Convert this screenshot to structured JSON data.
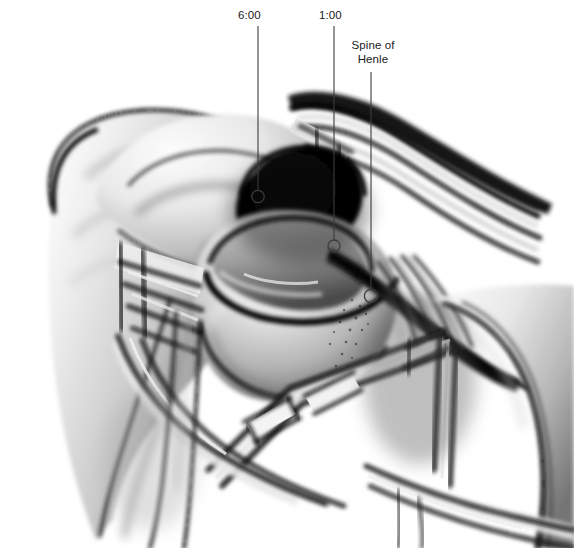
{
  "figure": {
    "kind": "medical-illustration",
    "background_color": "#ffffff",
    "width": 574,
    "height": 548,
    "ink_color": "#000000",
    "leader_color": "#3c3c3c"
  },
  "annotations": [
    {
      "id": "clock-6",
      "label": "6:00",
      "label_x": 238,
      "label_y": 8,
      "leader": {
        "x1": 258,
        "y1": 26,
        "x2": 258,
        "y2": 190
      },
      "marker": {
        "cx": 258,
        "cy": 196.5,
        "r": 6.2
      }
    },
    {
      "id": "clock-1",
      "label": "1:00",
      "label_x": 319,
      "label_y": 8,
      "leader": {
        "x1": 334,
        "y1": 26,
        "x2": 334,
        "y2": 240
      },
      "marker": {
        "cx": 334,
        "cy": 246,
        "r": 6.0
      }
    },
    {
      "id": "spine-of-henle",
      "label": "Spine of\nHenle",
      "label_line_1": "Spine of",
      "label_line_2": "Henle",
      "label_x": 344,
      "label_y": 38,
      "leader": {
        "x1": 371,
        "y1": 72,
        "x2": 371,
        "y2": 289
      },
      "marker": {
        "cx": 371,
        "cy": 296,
        "r": 6.6
      }
    }
  ],
  "palette": {
    "paper": "#ffffff",
    "bone_light": "#f2f2f2",
    "bone_mid": "#b9b9b9",
    "shadow": "#5c5c5c",
    "deep_shadow": "#141414",
    "outline": "#0a0a0a",
    "cavity_black": "#060606"
  }
}
